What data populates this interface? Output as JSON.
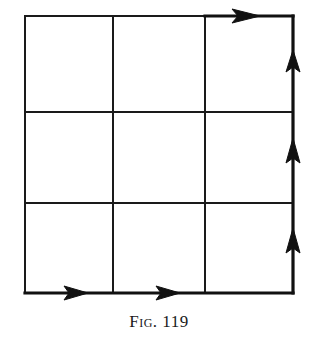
{
  "figure": {
    "caption": "Fig. 119",
    "grid": {
      "rows": 3,
      "cols": 3,
      "x_lines": [
        25,
        113,
        205,
        293
      ],
      "y_lines": [
        16,
        112,
        203,
        293
      ],
      "line_color": "#1a1a1a"
    },
    "path": {
      "description": "Path along the bottom edge left-to-right, then up the right edge to the top-right corner, with direction arrows",
      "segments": [
        "bottom edge (left to right)",
        "right edge (bottom to top)"
      ],
      "arrows": [
        {
          "edge": "bottom",
          "direction": "right",
          "tip": [
            88,
            293
          ]
        },
        {
          "edge": "bottom",
          "direction": "right",
          "tip": [
            180,
            293
          ]
        },
        {
          "edge": "right",
          "direction": "up",
          "tip": [
            293,
            228
          ]
        },
        {
          "edge": "right",
          "direction": "up",
          "tip": [
            293,
            138
          ]
        },
        {
          "edge": "right",
          "direction": "up",
          "tip": [
            293,
            50
          ]
        },
        {
          "edge": "top",
          "direction": "right",
          "tip": [
            260,
            16
          ]
        }
      ]
    }
  }
}
